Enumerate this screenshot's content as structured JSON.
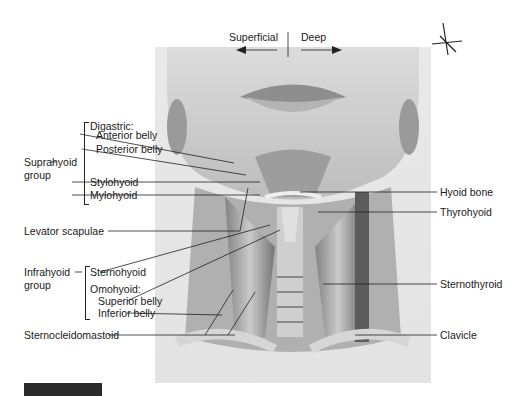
{
  "orientation": {
    "left_label": "Superficial",
    "right_label": "Deep"
  },
  "groups": {
    "suprahyoid": {
      "label_line1": "Suprahyoid",
      "label_line2": "group"
    },
    "infrahyoid": {
      "label_line1": "Infrahyoid",
      "label_line2": "group"
    }
  },
  "labels_left": {
    "digastric": "Digastric:",
    "anterior_belly": "Anterior belly",
    "posterior_belly": "Posterior belly",
    "stylohyoid": "Stylohyoid",
    "mylohyoid": "Mylohyoid",
    "levator_scapulae": "Levator scapulae",
    "sternohyoid": "Sternohyoid",
    "omohyoid": "Omohyoid:",
    "superior_belly": "Superior belly",
    "inferior_belly": "Inferior belly",
    "sternocleidomastoid": "Sternocleidomastoid"
  },
  "labels_right": {
    "hyoid_bone": "Hyoid bone",
    "thyrohyoid": "Thyrohyoid",
    "sternothyroid": "Sternothyroid",
    "clavicle": "Clavicle"
  },
  "colors": {
    "frame_bg": "#e6e6e6",
    "leader_line": "#222222",
    "ink": "#1a1a1a"
  }
}
